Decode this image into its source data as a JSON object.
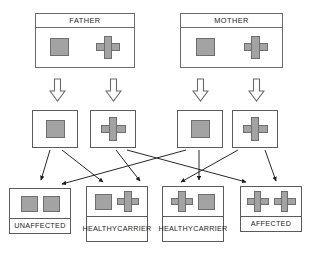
{
  "diagram": {
    "colors": {
      "allele_fill": "#a3a3a3",
      "allele_stroke": "#6e6e6e",
      "box_stroke": "#5b5b5b",
      "text": "#1b1b1b",
      "background": "#ffffff"
    }
  },
  "parents": [
    {
      "id": "father",
      "label": "FATHER",
      "alleles": [
        "square",
        "cross"
      ]
    },
    {
      "id": "mother",
      "label": "MOTHER",
      "alleles": [
        "square",
        "cross"
      ]
    }
  ],
  "gametes": [
    {
      "id": "father-gamete-1",
      "allele": "square",
      "parent": "father"
    },
    {
      "id": "father-gamete-2",
      "allele": "cross",
      "parent": "father"
    },
    {
      "id": "mother-gamete-1",
      "allele": "square",
      "parent": "mother"
    },
    {
      "id": "mother-gamete-2",
      "allele": "cross",
      "parent": "mother"
    }
  ],
  "offspring": [
    {
      "id": "offspring-1",
      "label": "UNAFFECTED",
      "label_lines": [
        "UNAFFECTED"
      ],
      "alleles": [
        "square",
        "square"
      ]
    },
    {
      "id": "offspring-2",
      "label": "HEALTHY CARRIER",
      "label_lines": [
        "HEALTHY",
        "CARRIER"
      ],
      "alleles": [
        "square",
        "cross"
      ]
    },
    {
      "id": "offspring-3",
      "label": "HEALTHY CARRIER",
      "label_lines": [
        "HEALTHY",
        "CARRIER"
      ],
      "alleles": [
        "cross",
        "square"
      ]
    },
    {
      "id": "offspring-4",
      "label": "AFFECTED",
      "label_lines": [
        "AFFECTED"
      ],
      "alleles": [
        "cross",
        "cross"
      ]
    }
  ],
  "block_arrows": [
    {
      "id": "block-arrow-1",
      "direction": "down",
      "from": "father",
      "to": "father-gamete-1"
    },
    {
      "id": "block-arrow-2",
      "direction": "down",
      "from": "father",
      "to": "father-gamete-2"
    },
    {
      "id": "block-arrow-3",
      "direction": "down",
      "from": "mother",
      "to": "mother-gamete-1"
    },
    {
      "id": "block-arrow-4",
      "direction": "down",
      "from": "mother",
      "to": "mother-gamete-2"
    }
  ],
  "connectors": [
    {
      "id": "link-1",
      "from": "father-gamete-1",
      "to": "offspring-1"
    },
    {
      "id": "link-2",
      "from": "father-gamete-1",
      "to": "offspring-2"
    },
    {
      "id": "link-3",
      "from": "father-gamete-2",
      "to": "offspring-3"
    },
    {
      "id": "link-4",
      "from": "father-gamete-2",
      "to": "offspring-4"
    },
    {
      "id": "link-5",
      "from": "mother-gamete-1",
      "to": "offspring-1"
    },
    {
      "id": "link-6",
      "from": "mother-gamete-1",
      "to": "offspring-3"
    },
    {
      "id": "link-7",
      "from": "mother-gamete-2",
      "to": "offspring-2"
    },
    {
      "id": "link-8",
      "from": "mother-gamete-2",
      "to": "offspring-4"
    }
  ]
}
